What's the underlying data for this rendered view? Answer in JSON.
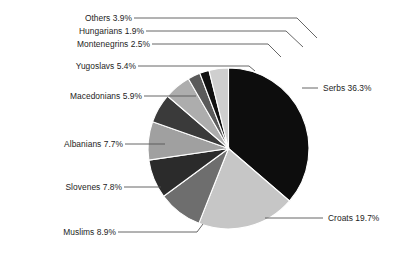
{
  "chart_data": {
    "type": "pie",
    "title": "",
    "subtitle": "",
    "xlabel": "",
    "ylabel": "",
    "legend_position": "callout-labels",
    "grid": false,
    "start_angle_deg": 0,
    "direction": "clockwise",
    "total_percent": 100.0,
    "categories": [
      "Serbs",
      "Croats",
      "Muslims",
      "Slovenes",
      "Albanians",
      "Macedonians",
      "Yugoslavs",
      "Montenegrins",
      "Hungarians",
      "Others"
    ],
    "values": [
      36.3,
      19.7,
      8.9,
      7.8,
      7.7,
      5.9,
      5.4,
      2.5,
      1.9,
      3.9
    ],
    "slice_colors": [
      "#0d0d0d",
      "#c6c6c6",
      "#6e6e6e",
      "#2b2b2b",
      "#a0a0a0",
      "#3a3a3a",
      "#adadad",
      "#5a5a5a",
      "#101010",
      "#cfcfcf"
    ],
    "slices": [
      {
        "label": "Serbs 36.3%",
        "name": "Serbs",
        "value": 36.3,
        "color": "#0d0d0d"
      },
      {
        "label": "Croats 19.7%",
        "name": "Croats",
        "value": 19.7,
        "color": "#c6c6c6"
      },
      {
        "label": "Muslims 8.9%",
        "name": "Muslims",
        "value": 8.9,
        "color": "#6e6e6e"
      },
      {
        "label": "Slovenes 7.8%",
        "name": "Slovenes",
        "value": 7.8,
        "color": "#2b2b2b"
      },
      {
        "label": "Albanians 7.7%",
        "name": "Albanians",
        "value": 7.7,
        "color": "#a0a0a0"
      },
      {
        "label": "Macedonians 5.9%",
        "name": "Macedonians",
        "value": 5.9,
        "color": "#3a3a3a"
      },
      {
        "label": "Yugoslavs 5.4%",
        "name": "Yugoslavs",
        "value": 5.4,
        "color": "#adadad"
      },
      {
        "label": "Montenegrins 2.5%",
        "name": "Montenegrins",
        "value": 2.5,
        "color": "#5a5a5a"
      },
      {
        "label": "Hungarians 1.9%",
        "name": "Hungarians",
        "value": 1.9,
        "color": "#101010"
      },
      {
        "label": "Others 3.9%",
        "name": "Others",
        "value": 3.9,
        "color": "#cfcfcf"
      }
    ]
  },
  "labels": {
    "others": "Others 3.9%",
    "hungarians": "Hungarians 1.9%",
    "montenegrins": "Montenegrins 2.5%",
    "yugoslavs": "Yugoslavs 5.4%",
    "macedonians": "Macedonians 5.9%",
    "albanians": "Albanians 7.7%",
    "slovenes": "Slovenes 7.8%",
    "muslims": "Muslims 8.9%",
    "serbs": "Serbs 36.3%",
    "croats": "Croats 19.7%"
  },
  "style": {
    "background": "#ffffff",
    "leader_line_color": "#565656",
    "text_color": "#1d1d1d"
  }
}
